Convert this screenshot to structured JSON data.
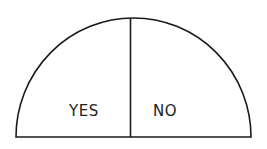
{
  "diagram": {
    "shape": "semicircle",
    "stroke_color": "#1a1a1a",
    "background": "#ffffff",
    "regions": [
      {
        "label": "YES",
        "side": "left"
      },
      {
        "label": "NO",
        "side": "right"
      }
    ]
  }
}
